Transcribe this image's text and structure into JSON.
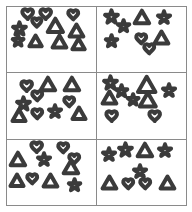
{
  "figure": {
    "kind": "shape-counting-grid",
    "grid_rows": 3,
    "grid_columns": 2,
    "stroke_color": "#3b3b3b",
    "panel_border_color": "#8a8a8a",
    "background_color": "#ffffff"
  },
  "shape_names": {
    "heart": "heart-icon",
    "star": "star-icon",
    "triangle": "triangle-icon"
  },
  "panels": [
    {
      "id": "panel-1",
      "position": "top-left",
      "counts": {
        "heart": 4,
        "star": 2,
        "triangle": 6
      },
      "shapes": [
        {
          "type": "heart",
          "x": 16,
          "y": 4,
          "size": 15,
          "rotate": 0
        },
        {
          "type": "heart",
          "x": 36,
          "y": 4,
          "size": 15,
          "rotate": 0
        },
        {
          "type": "heart",
          "x": 68,
          "y": 5,
          "size": 14,
          "rotate": 0
        },
        {
          "type": "heart",
          "x": 27,
          "y": 18,
          "size": 13,
          "rotate": 0
        },
        {
          "type": "star",
          "x": 5,
          "y": 24,
          "size": 19,
          "rotate": 0
        },
        {
          "type": "star",
          "x": 5,
          "y": 43,
          "size": 16,
          "rotate": 0
        },
        {
          "type": "triangle",
          "x": 44,
          "y": 17,
          "size": 21,
          "rotate": 0
        },
        {
          "type": "triangle",
          "x": 69,
          "y": 26,
          "size": 19,
          "rotate": 0
        },
        {
          "type": "triangle",
          "x": 24,
          "y": 44,
          "size": 17,
          "rotate": 0
        },
        {
          "type": "triangle",
          "x": 50,
          "y": 43,
          "size": 19,
          "rotate": 0
        },
        {
          "type": "triangle",
          "x": 72,
          "y": 48,
          "size": 17,
          "rotate": 0
        },
        {
          "type": "triangle",
          "x": 0,
          "y": 47,
          "size": 1,
          "rotate": 0
        }
      ]
    },
    {
      "id": "panel-2",
      "position": "top-right",
      "counts": {
        "heart": 2,
        "star": 4,
        "triangle": 2
      },
      "shapes": [
        {
          "type": "star",
          "x": 7,
          "y": 6,
          "size": 19,
          "rotate": 0
        },
        {
          "type": "star",
          "x": 22,
          "y": 20,
          "size": 17,
          "rotate": 0
        },
        {
          "type": "star",
          "x": 67,
          "y": 7,
          "size": 18,
          "rotate": 0
        },
        {
          "type": "star",
          "x": 8,
          "y": 44,
          "size": 17,
          "rotate": 0
        },
        {
          "type": "triangle",
          "x": 41,
          "y": 6,
          "size": 20,
          "rotate": 0
        },
        {
          "type": "triangle",
          "x": 64,
          "y": 38,
          "size": 19,
          "rotate": 0
        },
        {
          "type": "heart",
          "x": 43,
          "y": 42,
          "size": 14,
          "rotate": 0
        },
        {
          "type": "heart",
          "x": 52,
          "y": 57,
          "size": 14,
          "rotate": 0
        }
      ]
    },
    {
      "id": "panel-3",
      "position": "middle-left",
      "counts": {
        "heart": 4,
        "star": 2,
        "triangle": 4
      },
      "shapes": [
        {
          "type": "heart",
          "x": 15,
          "y": 12,
          "size": 15,
          "rotate": 0
        },
        {
          "type": "heart",
          "x": 28,
          "y": 27,
          "size": 14,
          "rotate": 0
        },
        {
          "type": "heart",
          "x": 63,
          "y": 36,
          "size": 14,
          "rotate": 0
        },
        {
          "type": "heart",
          "x": 28,
          "y": 54,
          "size": 14,
          "rotate": 0
        },
        {
          "type": "star",
          "x": 9,
          "y": 36,
          "size": 19,
          "rotate": 0
        },
        {
          "type": "star",
          "x": 45,
          "y": 49,
          "size": 18,
          "rotate": 0
        },
        {
          "type": "triangle",
          "x": 36,
          "y": 6,
          "size": 20,
          "rotate": 0
        },
        {
          "type": "triangle",
          "x": 64,
          "y": 6,
          "size": 20,
          "rotate": 0
        },
        {
          "type": "triangle",
          "x": 5,
          "y": 55,
          "size": 18,
          "rotate": 0
        },
        {
          "type": "triangle",
          "x": 72,
          "y": 52,
          "size": 18,
          "rotate": 0
        }
      ]
    },
    {
      "id": "panel-4",
      "position": "middle-right",
      "counts": {
        "heart": 2,
        "star": 4,
        "triangle": 3
      },
      "shapes": [
        {
          "type": "star",
          "x": 6,
          "y": 5,
          "size": 19,
          "rotate": 0
        },
        {
          "type": "star",
          "x": 20,
          "y": 18,
          "size": 17,
          "rotate": 0
        },
        {
          "type": "star",
          "x": 33,
          "y": 32,
          "size": 16,
          "rotate": 0
        },
        {
          "type": "star",
          "x": 72,
          "y": 17,
          "size": 18,
          "rotate": 0
        },
        {
          "type": "triangle",
          "x": 44,
          "y": 5,
          "size": 24,
          "rotate": 0
        },
        {
          "type": "triangle",
          "x": 5,
          "y": 27,
          "size": 19,
          "rotate": 0
        },
        {
          "type": "triangle",
          "x": 47,
          "y": 28,
          "size": 22,
          "rotate": 0
        },
        {
          "type": "heart",
          "x": 10,
          "y": 57,
          "size": 15,
          "rotate": 0
        },
        {
          "type": "heart",
          "x": 58,
          "y": 57,
          "size": 15,
          "rotate": 0
        }
      ]
    },
    {
      "id": "panel-5",
      "position": "bottom-left",
      "counts": {
        "heart": 4,
        "star": 2,
        "triangle": 4
      },
      "shapes": [
        {
          "type": "heart",
          "x": 26,
          "y": 4,
          "size": 15,
          "rotate": 0
        },
        {
          "type": "heart",
          "x": 57,
          "y": 5,
          "size": 14,
          "rotate": 0
        },
        {
          "type": "heart",
          "x": 69,
          "y": 22,
          "size": 14,
          "rotate": 0
        },
        {
          "type": "heart",
          "x": 22,
          "y": 52,
          "size": 14,
          "rotate": 0
        },
        {
          "type": "star",
          "x": 33,
          "y": 20,
          "size": 18,
          "rotate": 0
        },
        {
          "type": "star",
          "x": 68,
          "y": 60,
          "size": 17,
          "rotate": 0
        },
        {
          "type": "triangle",
          "x": 3,
          "y": 18,
          "size": 20,
          "rotate": 0
        },
        {
          "type": "triangle",
          "x": 62,
          "y": 30,
          "size": 20,
          "rotate": 0
        },
        {
          "type": "triangle",
          "x": 3,
          "y": 52,
          "size": 18,
          "rotate": 0
        },
        {
          "type": "triangle",
          "x": 40,
          "y": 52,
          "size": 19,
          "rotate": 0
        }
      ]
    },
    {
      "id": "panel-6",
      "position": "bottom-right",
      "counts": {
        "heart": 2,
        "star": 4,
        "triangle": 3
      },
      "shapes": [
        {
          "type": "star",
          "x": 5,
          "y": 13,
          "size": 18,
          "rotate": 0
        },
        {
          "type": "star",
          "x": 23,
          "y": 5,
          "size": 19,
          "rotate": 0
        },
        {
          "type": "star",
          "x": 68,
          "y": 6,
          "size": 18,
          "rotate": 0
        },
        {
          "type": "star",
          "x": 40,
          "y": 38,
          "size": 18,
          "rotate": 0
        },
        {
          "type": "triangle",
          "x": 44,
          "y": 5,
          "size": 20,
          "rotate": 0
        },
        {
          "type": "triangle",
          "x": 5,
          "y": 55,
          "size": 19,
          "rotate": 0
        },
        {
          "type": "triangle",
          "x": 70,
          "y": 55,
          "size": 19,
          "rotate": 0
        },
        {
          "type": "heart",
          "x": 29,
          "y": 60,
          "size": 14,
          "rotate": 0
        },
        {
          "type": "heart",
          "x": 48,
          "y": 60,
          "size": 14,
          "rotate": 0
        }
      ]
    }
  ]
}
